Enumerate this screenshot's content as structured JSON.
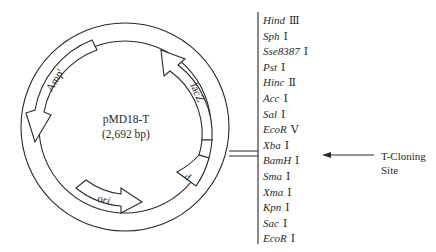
{
  "plasmid": {
    "name": "pMD18-T",
    "size": "(2,692 bp)"
  },
  "features": {
    "amp": {
      "label": "Amp",
      "superscript": "r"
    },
    "lacz": {
      "label": "lacZ"
    },
    "ori": {
      "label": "ori"
    },
    "promoter": {
      "label": "P"
    }
  },
  "mcs": {
    "sites": [
      {
        "name": "Hind",
        "numeral": "Ⅲ"
      },
      {
        "name": "Sph",
        "numeral": "Ⅰ"
      },
      {
        "name": "Sse8387",
        "numeral": "Ⅰ"
      },
      {
        "name": "Pst",
        "numeral": "Ⅰ"
      },
      {
        "name": "Hinc",
        "numeral": "Ⅱ"
      },
      {
        "name": "Acc",
        "numeral": "Ⅰ"
      },
      {
        "name": "Sal",
        "numeral": "Ⅰ"
      },
      {
        "name": "EcoR",
        "numeral": "Ⅴ"
      },
      {
        "name": "Xba",
        "numeral": "Ⅰ"
      },
      {
        "name": "BamH",
        "numeral": "Ⅰ"
      },
      {
        "name": "Sma",
        "numeral": "Ⅰ"
      },
      {
        "name": "Xma",
        "numeral": "Ⅰ"
      },
      {
        "name": "Kpn",
        "numeral": "Ⅰ"
      },
      {
        "name": "Sac",
        "numeral": "Ⅰ"
      },
      {
        "name": "EcoR",
        "numeral": "Ⅰ"
      }
    ],
    "cloning_site_label": "T-Cloning Site"
  },
  "colors": {
    "stroke": "#2a2a2a",
    "background": "#ffffff"
  }
}
